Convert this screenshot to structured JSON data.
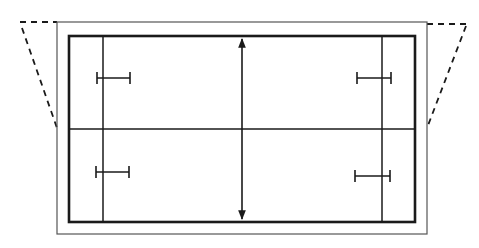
{
  "diagram": {
    "type": "technical-line-drawing",
    "colors": {
      "line": "#1a1a1a",
      "thin_line": "#555555",
      "background": "#ffffff"
    },
    "elements": {
      "outer_boundary": {
        "x1": 57,
        "y1": 22,
        "x2": 427,
        "y2": 234,
        "style": "thin"
      },
      "inner_boundary": {
        "x1": 69,
        "y1": 36,
        "x2": 415,
        "y2": 222,
        "style": "thick"
      },
      "center_line": {
        "y": 129
      },
      "side_lines": [
        {
          "x": 103
        },
        {
          "x": 382
        }
      ],
      "dimension_arrow": {
        "x": 242,
        "y_top": 37,
        "y_bottom": 221,
        "heads": "both"
      },
      "i_bars": [
        {
          "position": "top-left",
          "x1": 97,
          "x2": 130,
          "y": 78
        },
        {
          "position": "bottom-left",
          "x1": 96,
          "x2": 129,
          "y": 173
        },
        {
          "position": "top-right",
          "x1": 357,
          "x2": 391,
          "y": 78
        },
        {
          "position": "bottom-right",
          "x1": 355,
          "x2": 390,
          "y": 176
        }
      ],
      "dashed_projections": [
        {
          "side": "left",
          "points": [
            [
              57,
              22
            ],
            [
              20,
              22
            ],
            [
              22,
              28
            ],
            [
              57,
              128
            ]
          ]
        },
        {
          "side": "right",
          "points": [
            [
              427,
              24
            ],
            [
              466,
              24
            ],
            [
              466,
              26
            ],
            [
              427,
              128
            ]
          ]
        }
      ]
    },
    "labels": []
  }
}
